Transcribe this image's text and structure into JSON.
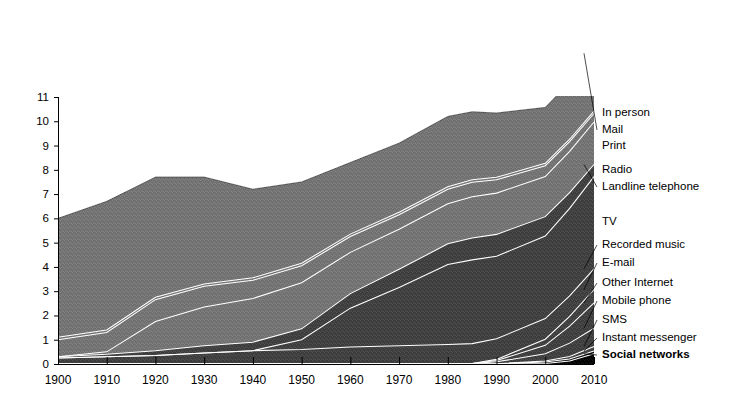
{
  "header": {
    "title": "Time spent consuming messages by technology type in the United States",
    "subtitle": "Hours per day"
  },
  "legend": {
    "position": "top-right",
    "items": [
      {
        "label": "Non-digital",
        "color": "#6e6e6e",
        "bold": false
      },
      {
        "label": "Potential to be socially enabled",
        "color": "#3a3a3a",
        "bold": false
      },
      {
        "label": "Currently socially enabled",
        "color": "#000000",
        "bold": true
      }
    ]
  },
  "series_labels": [
    {
      "name": "In person",
      "y": 113,
      "bold": false,
      "leader": false
    },
    {
      "name": "Mail",
      "y": 130,
      "bold": false,
      "leader": true
    },
    {
      "name": "Print",
      "y": 146,
      "bold": false,
      "leader": false
    },
    {
      "name": "Radio",
      "y": 170,
      "bold": false,
      "leader": false
    },
    {
      "name": "Landline telephone",
      "y": 187,
      "bold": false,
      "leader": true
    },
    {
      "name": "TV",
      "y": 222,
      "bold": false,
      "leader": false
    },
    {
      "name": "Recorded music",
      "y": 245,
      "bold": false,
      "leader": true
    },
    {
      "name": "E-mail",
      "y": 263,
      "bold": false,
      "leader": true
    },
    {
      "name": "Other Internet",
      "y": 283,
      "bold": false,
      "leader": true
    },
    {
      "name": "Mobile phone",
      "y": 301,
      "bold": false,
      "leader": true
    },
    {
      "name": "SMS",
      "y": 320,
      "bold": false,
      "leader": true
    },
    {
      "name": "Instant messenger",
      "y": 338,
      "bold": false,
      "leader": true
    },
    {
      "name": "Social networks",
      "y": 355,
      "bold": true,
      "leader": true
    }
  ],
  "chart_data": {
    "type": "area",
    "stacked": true,
    "title": "Time spent consuming messages by technology type in the United States",
    "xlabel": "",
    "ylabel": "Hours per day",
    "ylim": [
      0,
      11
    ],
    "yticks": [
      0,
      1,
      2,
      3,
      4,
      5,
      6,
      7,
      8,
      9,
      10,
      11
    ],
    "ytick_labels": [
      "0",
      "1",
      "2",
      "3",
      "4",
      "5",
      "6",
      "7",
      "8",
      "9",
      "10",
      "11"
    ],
    "xlim": [
      1900,
      2010
    ],
    "xticks": [
      1900,
      1910,
      1920,
      1930,
      1940,
      1950,
      1960,
      1970,
      1980,
      1990,
      2000,
      2010
    ],
    "xtick_labels": [
      "1900",
      "1910",
      "1920",
      "1930",
      "1940",
      "1950",
      "1960",
      "1970",
      "1980",
      "1990",
      "2000",
      "2010"
    ],
    "grid": false,
    "x": [
      1900,
      1910,
      1920,
      1930,
      1940,
      1950,
      1960,
      1970,
      1980,
      1985,
      1990,
      2000,
      2005,
      2010
    ],
    "group_colors": {
      "non_digital": "#6e6e6e",
      "potential": "#3a3a3a",
      "current": "#000000"
    },
    "series": [
      {
        "name": "Social networks",
        "group": "current",
        "values": [
          0.0,
          0.0,
          0.0,
          0.0,
          0.0,
          0.0,
          0.0,
          0.0,
          0.0,
          0.0,
          0.0,
          0.02,
          0.12,
          0.42
        ]
      },
      {
        "name": "Instant messenger",
        "group": "current",
        "values": [
          0.0,
          0.0,
          0.0,
          0.0,
          0.0,
          0.0,
          0.0,
          0.0,
          0.0,
          0.0,
          0.01,
          0.06,
          0.09,
          0.12
        ]
      },
      {
        "name": "SMS",
        "group": "potential",
        "values": [
          0.0,
          0.0,
          0.0,
          0.0,
          0.0,
          0.0,
          0.0,
          0.0,
          0.0,
          0.0,
          0.0,
          0.04,
          0.1,
          0.18
        ]
      },
      {
        "name": "Mobile phone",
        "group": "potential",
        "values": [
          0.0,
          0.0,
          0.0,
          0.0,
          0.0,
          0.0,
          0.0,
          0.0,
          0.0,
          0.02,
          0.08,
          0.3,
          0.55,
          0.75
        ]
      },
      {
        "name": "Other Internet",
        "group": "potential",
        "values": [
          0.0,
          0.0,
          0.0,
          0.0,
          0.0,
          0.0,
          0.0,
          0.0,
          0.0,
          0.0,
          0.05,
          0.35,
          0.7,
          1.05
        ]
      },
      {
        "name": "E-mail",
        "group": "potential",
        "values": [
          0.0,
          0.0,
          0.0,
          0.0,
          0.0,
          0.0,
          0.0,
          0.0,
          0.0,
          0.0,
          0.05,
          0.25,
          0.4,
          0.55
        ]
      },
      {
        "name": "Recorded music",
        "group": "potential",
        "values": [
          0.25,
          0.3,
          0.35,
          0.45,
          0.55,
          0.6,
          0.7,
          0.75,
          0.8,
          0.82,
          0.85,
          0.85,
          0.85,
          0.85
        ]
      },
      {
        "name": "TV",
        "group": "potential",
        "values": [
          0.0,
          0.0,
          0.0,
          0.0,
          0.0,
          0.4,
          1.6,
          2.4,
          3.3,
          3.45,
          3.4,
          3.4,
          3.6,
          3.8
        ]
      },
      {
        "name": "Landline telephone",
        "group": "potential",
        "values": [
          0.05,
          0.1,
          0.2,
          0.3,
          0.35,
          0.45,
          0.6,
          0.75,
          0.85,
          0.9,
          0.9,
          0.8,
          0.65,
          0.5
        ]
      },
      {
        "name": "Radio",
        "group": "non_digital",
        "values": [
          0.0,
          0.1,
          1.2,
          1.6,
          1.8,
          1.9,
          1.7,
          1.65,
          1.65,
          1.7,
          1.7,
          1.65,
          1.7,
          1.75
        ]
      },
      {
        "name": "Print",
        "group": "non_digital",
        "values": [
          0.7,
          0.8,
          0.9,
          0.85,
          0.75,
          0.7,
          0.65,
          0.6,
          0.6,
          0.6,
          0.55,
          0.45,
          0.4,
          0.35
        ]
      },
      {
        "name": "Mail",
        "group": "non_digital",
        "values": [
          0.1,
          0.1,
          0.1,
          0.1,
          0.1,
          0.1,
          0.1,
          0.1,
          0.1,
          0.1,
          0.1,
          0.1,
          0.1,
          0.1
        ]
      },
      {
        "name": "In person",
        "group": "non_digital",
        "values": [
          4.9,
          5.3,
          4.95,
          4.4,
          3.65,
          3.35,
          2.95,
          2.85,
          2.9,
          2.8,
          2.65,
          2.3,
          2.35,
          2.43
        ]
      }
    ],
    "totals": [
      6.0,
      6.7,
      7.7,
      7.7,
      7.2,
      7.5,
      8.3,
      9.1,
      10.2,
      10.5,
      10.3,
      9.87,
      10.15,
      12.85
    ]
  }
}
